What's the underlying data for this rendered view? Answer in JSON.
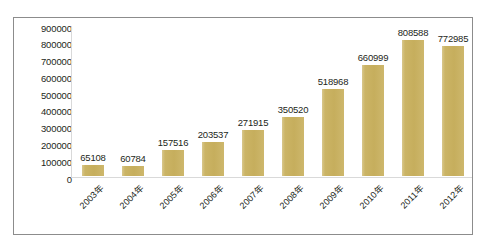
{
  "chart_data": {
    "type": "bar",
    "title": "",
    "xlabel": "",
    "ylabel": "",
    "categories": [
      "2003年",
      "2004年",
      "2005年",
      "2006年",
      "2007年",
      "2008年",
      "2009年",
      "2010年",
      "2011年",
      "2012年"
    ],
    "values": [
      65108,
      60784,
      157516,
      203537,
      271915,
      350520,
      518968,
      660999,
      808588,
      772985
    ],
    "value_labels": [
      "65108",
      "60784",
      "157516",
      "203537",
      "271915",
      "350520",
      "518968",
      "660999",
      "808588",
      "772985"
    ],
    "ylim": [
      0,
      900000
    ],
    "ytick_labels": [
      "900000",
      "800000",
      "700000",
      "600000",
      "500000",
      "400000",
      "300000",
      "200000",
      "100000",
      "0"
    ],
    "ytick_values": [
      900000,
      800000,
      700000,
      600000,
      500000,
      400000,
      300000,
      200000,
      100000,
      0
    ],
    "grid": false,
    "legend": null,
    "series_color": "#c9b368",
    "axis_color": "#d9d9d9",
    "text_color": "#231f20",
    "frame_color": "#8c8c8c",
    "background": "#ffffff"
  }
}
